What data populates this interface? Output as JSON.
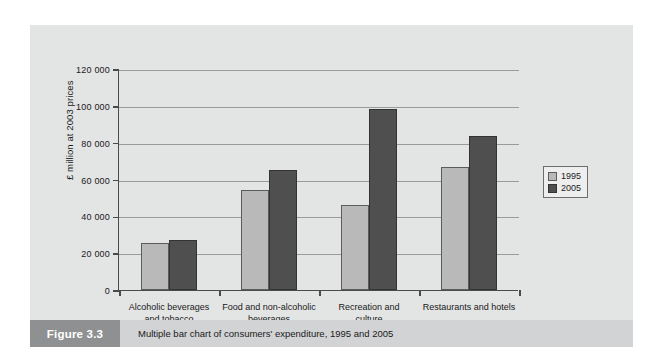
{
  "caption": {
    "figure_label": "Figure 3.3",
    "text": "Multiple bar chart of consumers' expenditure, 1995 and 2005"
  },
  "colors": {
    "series_1995": "#b9b9b9",
    "series_2005": "#4f4f4f",
    "panel_background": "#e3e4e4",
    "caption_block": "#8f9091",
    "caption_bar": "#d2d3d4",
    "axis": "#4a4a4a",
    "gridline": "#9a9a9a"
  },
  "chart_data": {
    "type": "bar",
    "title": "",
    "xlabel": "",
    "ylabel": "£ million at 2003 prices",
    "ylim": [
      0,
      120000
    ],
    "yticks": [
      0,
      20000,
      40000,
      60000,
      80000,
      100000,
      120000
    ],
    "ytick_labels": [
      "0",
      "20 000",
      "40 000",
      "60 000",
      "80 000",
      "100 000",
      "120 000"
    ],
    "grid": true,
    "legend_position": "right",
    "categories": [
      "Alcoholic beverages and tobacco",
      "Food and non-alcoholic beverages",
      "Recreation and culture",
      "Restaurants and hotels"
    ],
    "category_lines": [
      [
        "Alcoholic beverages",
        "and tobacco"
      ],
      [
        "Food and non-alcoholic",
        "beverages"
      ],
      [
        "Recreation and",
        "culture"
      ],
      [
        "Restaurants and hotels",
        ""
      ]
    ],
    "series": [
      {
        "name": "1995",
        "values": [
          25500,
          54500,
          46000,
          67000
        ]
      },
      {
        "name": "2005",
        "values": [
          27000,
          65000,
          98500,
          83500
        ]
      }
    ]
  }
}
